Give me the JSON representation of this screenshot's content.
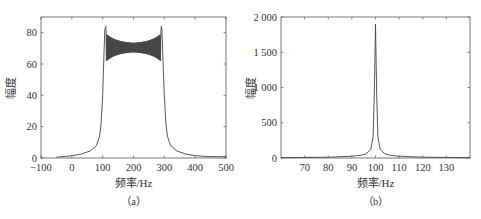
{
  "chart_data": [
    {
      "id": "a",
      "type": "line",
      "title": "",
      "caption": "（a）",
      "xlabel": "频率/Hz",
      "ylabel": "幅度",
      "xlim": [
        -100,
        500
      ],
      "ylim": [
        0,
        90
      ],
      "xticks": [
        -100,
        0,
        100,
        200,
        300,
        400,
        500
      ],
      "yticks": [
        0,
        20,
        40,
        60,
        80
      ],
      "xtick_labels": [
        "−100",
        "0",
        "100",
        "200",
        "300",
        "400",
        "500"
      ],
      "ytick_labels": [
        "0",
        "20",
        "40",
        "60",
        "80"
      ],
      "grid": false,
      "legend": null,
      "series": [
        {
          "name": "spectrum",
          "color": "#444444",
          "x": [
            -50,
            -20,
            0,
            30,
            60,
            80,
            90,
            95,
            100,
            104,
            107,
            110,
            112,
            130,
            160,
            200,
            240,
            270,
            288,
            290,
            292,
            295,
            300,
            305,
            310,
            320,
            340,
            370,
            400,
            430,
            470,
            500
          ],
          "y": [
            0.5,
            1,
            1.5,
            2.5,
            4.5,
            8,
            14,
            22,
            40,
            65,
            82,
            84,
            62,
            76,
            73,
            71,
            73,
            76,
            62,
            84,
            82,
            65,
            40,
            22,
            14,
            8,
            4.5,
            2.5,
            1.5,
            1,
            0.8,
            0.8
          ]
        }
      ],
      "annotations": [
        "plateau oscillation ~62–78 near band edges, ~68–73 at center"
      ]
    },
    {
      "id": "b",
      "type": "line",
      "title": "",
      "caption": "（b）",
      "xlabel": "频率/Hz",
      "ylabel": "幅度",
      "xlim": [
        60,
        140
      ],
      "ylim": [
        0,
        2000
      ],
      "xticks": [
        70,
        80,
        90,
        100,
        110,
        120,
        130
      ],
      "yticks": [
        0,
        500,
        1000,
        1500,
        2000
      ],
      "xtick_labels": [
        "70",
        "80",
        "90",
        "100",
        "110",
        "120",
        "130"
      ],
      "ytick_labels": [
        "0",
        "500",
        "1 000",
        "1 500",
        "2 000"
      ],
      "grid": false,
      "legend": null,
      "series": [
        {
          "name": "spectrum",
          "color": "#444444",
          "x": [
            60,
            70,
            80,
            85,
            90,
            94,
            96,
            98,
            99,
            99.5,
            100,
            100.5,
            101,
            102,
            104,
            106,
            110,
            115,
            120,
            130,
            140
          ],
          "y": [
            5,
            8,
            12,
            18,
            25,
            40,
            60,
            120,
            300,
            900,
            1900,
            900,
            300,
            120,
            60,
            40,
            25,
            18,
            12,
            8,
            5
          ]
        }
      ],
      "annotations": [
        "single sharp peak ≈1900 at 100 Hz"
      ]
    }
  ]
}
